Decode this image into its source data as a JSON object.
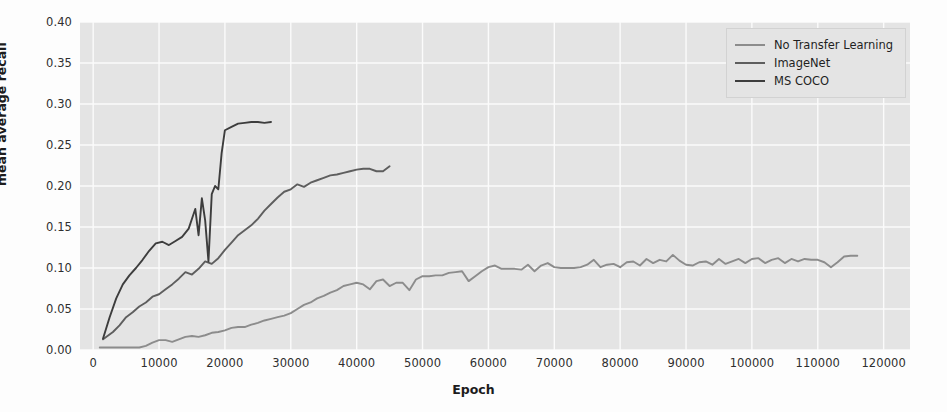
{
  "chart_data": {
    "type": "line",
    "title": "",
    "xlabel": "Epoch",
    "ylabel": "mean average recall",
    "xlim": [
      -2000,
      124000
    ],
    "ylim": [
      0.0,
      0.4
    ],
    "grid": true,
    "legend_position": "top-right",
    "xticks": [
      "0",
      "10000",
      "20000",
      "30000",
      "40000",
      "50000",
      "60000",
      "70000",
      "80000",
      "90000",
      "100000",
      "110000",
      "120000"
    ],
    "xtick_values": [
      0,
      10000,
      20000,
      30000,
      40000,
      50000,
      60000,
      70000,
      80000,
      90000,
      100000,
      110000,
      120000
    ],
    "yticks": [
      "0.00",
      "0.05",
      "0.10",
      "0.15",
      "0.20",
      "0.25",
      "0.30",
      "0.35",
      "0.40"
    ],
    "ytick_values": [
      0.0,
      0.05,
      0.1,
      0.15,
      0.2,
      0.25,
      0.3,
      0.35,
      0.4
    ],
    "series": [
      {
        "name": "No Transfer Learning",
        "color": "#8c8c8c",
        "x": [
          1000,
          3000,
          5000,
          7000,
          8000,
          9000,
          10000,
          11000,
          12000,
          13000,
          14000,
          15000,
          16000,
          17000,
          18000,
          19000,
          20000,
          21000,
          22000,
          23000,
          24000,
          25000,
          26000,
          27000,
          28000,
          29000,
          30000,
          31000,
          32000,
          33000,
          34000,
          35000,
          36000,
          37000,
          38000,
          39000,
          40000,
          41000,
          42000,
          43000,
          44000,
          45000,
          46000,
          47000,
          48000,
          49000,
          50000,
          51000,
          52000,
          53000,
          54000,
          55000,
          56000,
          57000,
          58000,
          59000,
          60000,
          61000,
          62000,
          63000,
          64000,
          65000,
          66000,
          67000,
          68000,
          69000,
          70000,
          71000,
          72000,
          73000,
          74000,
          75000,
          76000,
          77000,
          78000,
          79000,
          80000,
          81000,
          82000,
          83000,
          84000,
          85000,
          86000,
          87000,
          88000,
          89000,
          90000,
          91000,
          92000,
          93000,
          94000,
          95000,
          96000,
          97000,
          98000,
          99000,
          100000,
          101000,
          102000,
          103000,
          104000,
          105000,
          106000,
          107000,
          108000,
          109000,
          110000,
          111000,
          112000,
          113000,
          114000,
          115000,
          116000
        ],
        "y": [
          0.003,
          0.003,
          0.003,
          0.003,
          0.005,
          0.009,
          0.012,
          0.012,
          0.01,
          0.013,
          0.016,
          0.017,
          0.016,
          0.018,
          0.021,
          0.022,
          0.024,
          0.027,
          0.028,
          0.028,
          0.031,
          0.033,
          0.036,
          0.038,
          0.04,
          0.042,
          0.045,
          0.05,
          0.055,
          0.058,
          0.063,
          0.066,
          0.07,
          0.073,
          0.078,
          0.08,
          0.082,
          0.08,
          0.074,
          0.084,
          0.086,
          0.078,
          0.082,
          0.082,
          0.073,
          0.086,
          0.09,
          0.09,
          0.091,
          0.091,
          0.094,
          0.095,
          0.096,
          0.084,
          0.09,
          0.096,
          0.101,
          0.103,
          0.099,
          0.099,
          0.099,
          0.098,
          0.104,
          0.096,
          0.103,
          0.106,
          0.101,
          0.1,
          0.1,
          0.1,
          0.101,
          0.104,
          0.11,
          0.101,
          0.104,
          0.105,
          0.101,
          0.107,
          0.108,
          0.103,
          0.111,
          0.106,
          0.11,
          0.108,
          0.116,
          0.109,
          0.104,
          0.103,
          0.107,
          0.108,
          0.104,
          0.111,
          0.105,
          0.108,
          0.111,
          0.106,
          0.111,
          0.112,
          0.106,
          0.11,
          0.112,
          0.106,
          0.111,
          0.108,
          0.111,
          0.11,
          0.11,
          0.107,
          0.101,
          0.107,
          0.114,
          0.115,
          0.115
        ]
      },
      {
        "name": "ImageNet",
        "color": "#5e5e5e",
        "x": [
          1500,
          3000,
          4000,
          5000,
          6000,
          7000,
          8000,
          9000,
          10000,
          11000,
          12000,
          13000,
          14000,
          15000,
          16000,
          17000,
          18000,
          19000,
          20000,
          21000,
          22000,
          23000,
          24000,
          25000,
          26000,
          27000,
          28000,
          29000,
          30000,
          31000,
          32000,
          33000,
          34000,
          35000,
          36000,
          37000,
          38000,
          39000,
          40000,
          41000,
          42000,
          43000,
          44000,
          45000
        ],
        "y": [
          0.013,
          0.022,
          0.03,
          0.04,
          0.046,
          0.053,
          0.058,
          0.065,
          0.068,
          0.074,
          0.08,
          0.087,
          0.095,
          0.092,
          0.099,
          0.108,
          0.105,
          0.112,
          0.122,
          0.131,
          0.14,
          0.146,
          0.152,
          0.16,
          0.17,
          0.178,
          0.186,
          0.193,
          0.196,
          0.202,
          0.199,
          0.204,
          0.207,
          0.21,
          0.213,
          0.214,
          0.216,
          0.218,
          0.22,
          0.221,
          0.221,
          0.218,
          0.218,
          0.224
        ]
      },
      {
        "name": "MS COCO",
        "color": "#3d3d3d",
        "x": [
          1500,
          2500,
          3500,
          4500,
          5500,
          6500,
          7500,
          8500,
          9500,
          10500,
          11500,
          12500,
          13500,
          14500,
          15000,
          15500,
          16000,
          16500,
          17000,
          17500,
          18000,
          18500,
          19000,
          19500,
          20000,
          21000,
          22000,
          23000,
          24000,
          25000,
          26000,
          27000
        ],
        "y": [
          0.014,
          0.04,
          0.063,
          0.08,
          0.091,
          0.1,
          0.11,
          0.121,
          0.13,
          0.132,
          0.128,
          0.133,
          0.138,
          0.148,
          0.16,
          0.172,
          0.14,
          0.185,
          0.158,
          0.108,
          0.19,
          0.2,
          0.196,
          0.24,
          0.268,
          0.272,
          0.276,
          0.277,
          0.278,
          0.278,
          0.277,
          0.278
        ]
      }
    ]
  },
  "legend": {
    "entries": [
      {
        "label": "No Transfer Learning",
        "color": "#8c8c8c"
      },
      {
        "label": "ImageNet",
        "color": "#5e5e5e"
      },
      {
        "label": "MS COCO",
        "color": "#3d3d3d"
      }
    ]
  },
  "style": {
    "plot_background": "#e4e4e4",
    "grid_color": "#fbfbfb",
    "figure_background": "#fdfdfd"
  }
}
